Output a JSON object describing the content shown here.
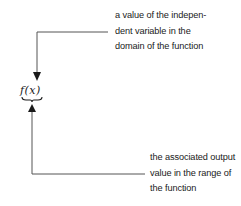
{
  "diagram": {
    "expression": "f(x)",
    "input_annotation": {
      "lines": [
        "a value of the indepen-",
        "dent variable in the",
        "domain of the function"
      ]
    },
    "output_annotation": {
      "lines": [
        "the associated output",
        "value in the range of",
        "the function"
      ]
    },
    "colors": {
      "line": "#555555",
      "text": "#1a1a1a",
      "background": "#ffffff"
    }
  }
}
